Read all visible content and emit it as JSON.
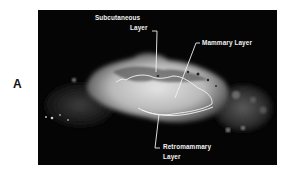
{
  "figure": {
    "panel_label": "A",
    "colors": {
      "background": "#050505",
      "tissue_bright": "#d8d8d8",
      "annotation": "#f2f2f2"
    },
    "annotations": [
      {
        "id": "subcutaneous",
        "line1": "Subcutaneous",
        "line2": "Layer"
      },
      {
        "id": "mammary",
        "line1": "Mammary Layer"
      },
      {
        "id": "retromammary",
        "line1": "Retromammary",
        "line2": "Layer"
      }
    ]
  }
}
